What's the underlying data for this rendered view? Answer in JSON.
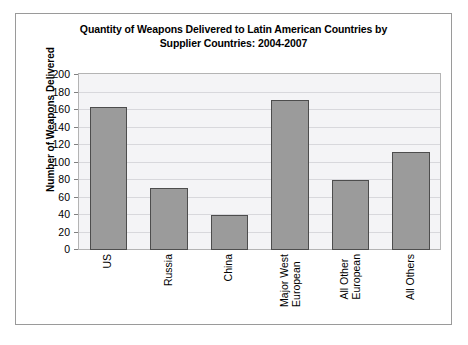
{
  "chart_data": {
    "type": "bar",
    "title": "Quantity of Weapons Delivered to Latin American Countries by Supplier Countries: 2004-2007",
    "title_line1": "Quantity of Weapons Delivered to Latin American Countries by",
    "title_line2": "Supplier Countries: 2004-2007",
    "xlabel": "",
    "ylabel": "Number of Weapons Delivered",
    "categories": [
      "US",
      "Russia",
      "China",
      "Major West European",
      "All Other European",
      "All Others"
    ],
    "category_lines": [
      [
        "US"
      ],
      [
        "Russia"
      ],
      [
        "China"
      ],
      [
        "Major West",
        "European"
      ],
      [
        "All Other",
        "European"
      ],
      [
        "All Others"
      ]
    ],
    "values": [
      163,
      71,
      40,
      172,
      80,
      112
    ],
    "ylim": [
      0,
      200
    ],
    "yticks": [
      200,
      180,
      160,
      140,
      120,
      100,
      80,
      60,
      40,
      20,
      0
    ],
    "grid": true,
    "legend": false,
    "bar_color": "#9b9b9b",
    "bar_edge_color": "#4d4d4d",
    "plot_background": "#f4f4f6",
    "gridline_color": "#d8d8dc",
    "frame_color": "#9a9a9a",
    "text_color": "#000000"
  }
}
